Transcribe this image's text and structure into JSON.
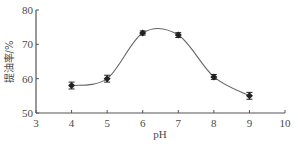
{
  "chart_data": {
    "type": "line",
    "title": "",
    "xlabel": "pH",
    "ylabel": "提油率/%",
    "xlim": [
      3,
      10
    ],
    "ylim": [
      50,
      80
    ],
    "x_ticks": [
      3,
      4,
      5,
      6,
      7,
      8,
      9,
      10
    ],
    "y_ticks": [
      50,
      60,
      70,
      80
    ],
    "grid": false,
    "legend": null,
    "series": [
      {
        "name": "提油率",
        "x": [
          4,
          5,
          6,
          7,
          8,
          9
        ],
        "values": [
          58.0,
          60.0,
          73.3,
          72.7,
          60.5,
          55.0
        ],
        "error": [
          1.0,
          1.0,
          0.6,
          0.7,
          0.7,
          1.0
        ],
        "marker": "diamond",
        "line": "smooth"
      }
    ]
  },
  "colors": {
    "axis": "#555555",
    "line": "#666666",
    "marker": "#222222",
    "text": "#4a4a4a"
  }
}
